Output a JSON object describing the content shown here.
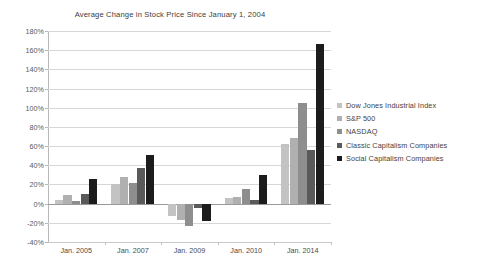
{
  "chart_data": {
    "type": "bar",
    "title": "Average Change in Stock Price Since January 1, 2004",
    "xlabel": "",
    "ylabel": "",
    "categories": [
      "Jan. 2005",
      "Jan. 2007",
      "Jan. 2009",
      "Jan. 2010",
      "Jan. 2014"
    ],
    "series": [
      {
        "name": "Dow Jones Industrial Index",
        "color": "#c3c3c3",
        "values": [
          4,
          20,
          -13,
          6,
          62
        ]
      },
      {
        "name": "S&P 500",
        "color": "#b0b0b0",
        "values": [
          9,
          28,
          -17,
          7,
          68
        ]
      },
      {
        "name": "NASDAQ",
        "color": "#8e8e8e",
        "values": [
          3,
          21,
          -23,
          15,
          105
        ]
      },
      {
        "name": "Classic Capitalism Companies",
        "color": "#5a5a5a",
        "values": [
          10,
          37,
          -5,
          4,
          56
        ]
      },
      {
        "name": "Social Capitalism Companies",
        "color": "#1c1c1c",
        "values": [
          26,
          51,
          -18,
          30,
          166
        ]
      }
    ],
    "ylim": [
      -40,
      180
    ],
    "ytick_step": 20,
    "ytick_labels": [
      "180%",
      "160%",
      "140%",
      "120%",
      "100%",
      "80%",
      "60%",
      "40%",
      "20%",
      "0%",
      "-20%",
      "-40%"
    ],
    "grid": true,
    "legend_position": "right"
  }
}
